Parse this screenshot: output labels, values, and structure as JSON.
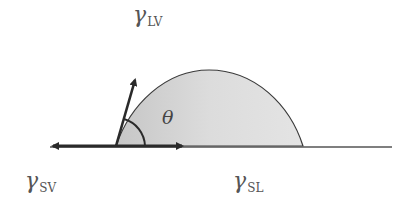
{
  "diagram": {
    "type": "contact-angle",
    "labels": {
      "liquid_vapor": {
        "symbol": "γ",
        "subscript": "LV"
      },
      "solid_vapor": {
        "symbol": "γ",
        "subscript": "SV"
      },
      "solid_liquid": {
        "symbol": "γ",
        "subscript": "SL"
      },
      "angle": "θ"
    },
    "colors": {
      "line": "#2a2a2a",
      "droplet_fill": "#d4d4d4",
      "droplet_outline": "#3a3a3a",
      "label_text": "#555555"
    }
  }
}
